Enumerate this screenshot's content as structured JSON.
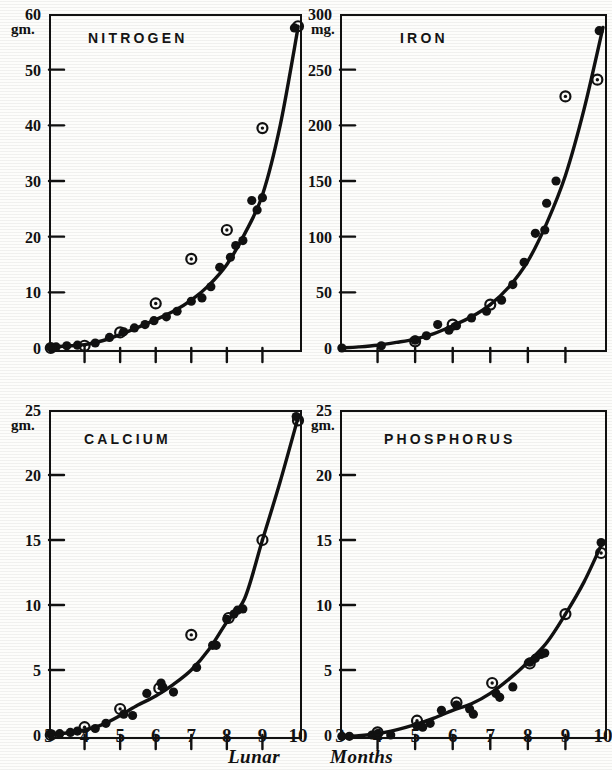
{
  "figure": {
    "background_color": "#fdfdfb",
    "ink_color": "#111111",
    "x_axis_title_part1": "Lunar",
    "x_axis_title_part2": "Months"
  },
  "chart_data": [
    {
      "type": "scatter",
      "title": "NITROGEN",
      "panel": "top-left",
      "xlabel": "Lunar Months",
      "ylabel": "gm.",
      "yunit": "gm.",
      "xlim": [
        3,
        10
      ],
      "ylim": [
        0,
        60
      ],
      "xticks": [
        3,
        4,
        5,
        6,
        7,
        8,
        9,
        10
      ],
      "xticklabels": [
        "",
        "",
        "",
        "",
        "",
        "",
        "",
        ""
      ],
      "yticks": [
        0,
        10,
        20,
        30,
        40,
        50,
        60
      ],
      "yticklabels": [
        "0",
        "10",
        "20",
        "30",
        "40",
        "50",
        "60"
      ],
      "grid": false,
      "legend": "none",
      "series": [
        {
          "name": "individual-analyses",
          "marker": "filled-circle",
          "points": [
            [
              3.05,
              0.1
            ],
            [
              3.2,
              0.2
            ],
            [
              3.5,
              0.4
            ],
            [
              3.8,
              0.5
            ],
            [
              4.3,
              0.9
            ],
            [
              4.7,
              1.9
            ],
            [
              5.1,
              2.9
            ],
            [
              5.4,
              3.6
            ],
            [
              5.7,
              4.2
            ],
            [
              5.95,
              4.9
            ],
            [
              6.3,
              5.6
            ],
            [
              6.6,
              6.6
            ],
            [
              7.0,
              8.4
            ],
            [
              7.3,
              9.0
            ],
            [
              7.55,
              11.0
            ],
            [
              7.8,
              14.5
            ],
            [
              8.1,
              16.3
            ],
            [
              8.25,
              18.4
            ],
            [
              8.45,
              19.3
            ],
            [
              8.7,
              26.5
            ],
            [
              8.85,
              24.8
            ],
            [
              9.0,
              27.0
            ],
            [
              9.9,
              57.5
            ]
          ]
        },
        {
          "name": "mean-values",
          "marker": "circled-dot",
          "points": [
            [
              3.05,
              0.0
            ],
            [
              4.0,
              0.4
            ],
            [
              5.0,
              2.8
            ],
            [
              6.0,
              8.0
            ],
            [
              7.0,
              16.0
            ],
            [
              8.0,
              21.2
            ],
            [
              9.0,
              39.5
            ],
            [
              10.0,
              57.8
            ]
          ]
        }
      ],
      "curve": [
        [
          3.0,
          0.2
        ],
        [
          3.5,
          0.35
        ],
        [
          4.0,
          0.6
        ],
        [
          4.5,
          1.3
        ],
        [
          5.0,
          2.4
        ],
        [
          5.5,
          3.7
        ],
        [
          6.0,
          5.1
        ],
        [
          6.5,
          6.6
        ],
        [
          7.0,
          8.6
        ],
        [
          7.5,
          11.3
        ],
        [
          8.0,
          15.0
        ],
        [
          8.5,
          20.5
        ],
        [
          9.0,
          27.5
        ],
        [
          9.5,
          40.0
        ],
        [
          10.0,
          57.5
        ]
      ]
    },
    {
      "type": "scatter",
      "title": "IRON",
      "panel": "top-right",
      "xlabel": "Lunar Months",
      "ylabel": "mg.",
      "yunit": "mg.",
      "xlim": [
        3,
        10
      ],
      "ylim": [
        0,
        300
      ],
      "xticks": [
        3,
        4,
        5,
        6,
        7,
        8,
        9,
        10
      ],
      "xticklabels": [
        "",
        "",
        "",
        "",
        "",
        "",
        "",
        ""
      ],
      "yticks": [
        0,
        50,
        100,
        150,
        200,
        250,
        300
      ],
      "yticklabels": [
        "0",
        "50",
        "100",
        "150",
        "200",
        "250",
        "300"
      ],
      "grid": false,
      "legend": "none",
      "series": [
        {
          "name": "individual-analyses",
          "marker": "filled-circle",
          "points": [
            [
              3.05,
              0.0
            ],
            [
              4.1,
              2.0
            ],
            [
              5.0,
              7.0
            ],
            [
              5.3,
              11.0
            ],
            [
              5.6,
              21.0
            ],
            [
              5.9,
              16.0
            ],
            [
              6.1,
              20.0
            ],
            [
              6.5,
              27.0
            ],
            [
              6.9,
              33.0
            ],
            [
              7.3,
              43.0
            ],
            [
              7.6,
              57.0
            ],
            [
              7.9,
              77.0
            ],
            [
              8.2,
              103.0
            ],
            [
              8.45,
              106.0
            ],
            [
              8.5,
              130.0
            ],
            [
              8.75,
              150.0
            ],
            [
              9.9,
              285.0
            ]
          ]
        },
        {
          "name": "mean-values",
          "marker": "circled-dot",
          "points": [
            [
              5.0,
              6.0
            ],
            [
              6.0,
              21.0
            ],
            [
              7.0,
              39.0
            ],
            [
              9.0,
              226.0
            ],
            [
              9.85,
              241.0
            ]
          ]
        }
      ],
      "curve": [
        [
          3.0,
          0.0
        ],
        [
          3.5,
          1.0
        ],
        [
          4.0,
          2.5
        ],
        [
          4.5,
          5.0
        ],
        [
          5.0,
          8.0
        ],
        [
          5.5,
          13.0
        ],
        [
          6.0,
          20.0
        ],
        [
          6.5,
          28.0
        ],
        [
          7.0,
          39.0
        ],
        [
          7.5,
          55.0
        ],
        [
          8.0,
          78.0
        ],
        [
          8.5,
          112.0
        ],
        [
          9.0,
          155.0
        ],
        [
          9.5,
          215.0
        ],
        [
          10.0,
          288.0
        ]
      ]
    },
    {
      "type": "scatter",
      "title": "CALCIUM",
      "panel": "bottom-left",
      "xlabel": "Lunar Months",
      "ylabel": "gm.",
      "yunit": "gm.",
      "xlim": [
        3,
        10
      ],
      "ylim": [
        0,
        25
      ],
      "xticks": [
        3,
        4,
        5,
        6,
        7,
        8,
        9,
        10
      ],
      "xticklabels": [
        "3",
        "4",
        "5",
        "6",
        "7",
        "8",
        "9",
        "10"
      ],
      "yticks": [
        0,
        5,
        10,
        15,
        20,
        25
      ],
      "yticklabels": [
        "0",
        "5",
        "10",
        "15",
        "20",
        "25"
      ],
      "grid": false,
      "legend": "none",
      "series": [
        {
          "name": "individual-analyses",
          "marker": "filled-circle",
          "points": [
            [
              3.05,
              0.05
            ],
            [
              3.3,
              0.1
            ],
            [
              3.6,
              0.2
            ],
            [
              3.8,
              0.3
            ],
            [
              4.3,
              0.5
            ],
            [
              4.6,
              0.9
            ],
            [
              5.1,
              1.6
            ],
            [
              5.35,
              1.5
            ],
            [
              5.75,
              3.2
            ],
            [
              6.15,
              4.0
            ],
            [
              6.2,
              3.7
            ],
            [
              6.5,
              3.3
            ],
            [
              7.15,
              5.2
            ],
            [
              7.6,
              6.9
            ],
            [
              7.7,
              6.9
            ],
            [
              8.0,
              8.9
            ],
            [
              8.2,
              9.3
            ],
            [
              8.3,
              9.6
            ],
            [
              8.45,
              9.7
            ],
            [
              9.95,
              24.5
            ]
          ]
        },
        {
          "name": "mean-values",
          "marker": "circled-dot",
          "points": [
            [
              3.05,
              0.0
            ],
            [
              4.0,
              0.6
            ],
            [
              5.0,
              2.0
            ],
            [
              6.1,
              3.6
            ],
            [
              7.0,
              7.7
            ],
            [
              8.05,
              9.0
            ],
            [
              9.0,
              15.0
            ],
            [
              10.0,
              24.2
            ]
          ]
        }
      ],
      "curve": [
        [
          3.0,
          0.05
        ],
        [
          3.5,
          0.15
        ],
        [
          4.0,
          0.4
        ],
        [
          4.5,
          0.8
        ],
        [
          5.0,
          1.5
        ],
        [
          5.5,
          2.3
        ],
        [
          6.0,
          3.0
        ],
        [
          6.5,
          3.9
        ],
        [
          7.0,
          5.0
        ],
        [
          7.5,
          6.6
        ],
        [
          8.0,
          8.7
        ],
        [
          8.5,
          10.5
        ],
        [
          9.0,
          15.0
        ],
        [
          9.5,
          19.5
        ],
        [
          10.0,
          24.4
        ]
      ]
    },
    {
      "type": "scatter",
      "title": "PHOSPHORUS",
      "panel": "bottom-right",
      "xlabel": "Lunar Months",
      "ylabel": "gm.",
      "yunit": "gm.",
      "xlim": [
        3,
        10
      ],
      "ylim": [
        0,
        25
      ],
      "xticks": [
        3,
        4,
        5,
        6,
        7,
        8,
        9,
        10
      ],
      "xticklabels": [
        "3",
        "4",
        "5",
        "6",
        "7",
        "8",
        "9",
        "10"
      ],
      "yticks": [
        0,
        5,
        10,
        15,
        20,
        25
      ],
      "yticklabels": [
        "0",
        "5",
        "10",
        "15",
        "20",
        "25"
      ],
      "grid": false,
      "legend": "none",
      "series": [
        {
          "name": "individual-analyses",
          "marker": "filled-circle",
          "points": [
            [
              3.05,
              -0.1
            ],
            [
              3.25,
              -0.1
            ],
            [
              3.85,
              0.0
            ],
            [
              4.0,
              0.1
            ],
            [
              4.35,
              0.0
            ],
            [
              5.05,
              0.7
            ],
            [
              5.2,
              0.6
            ],
            [
              5.4,
              0.9
            ],
            [
              5.7,
              1.9
            ],
            [
              6.1,
              2.3
            ],
            [
              6.45,
              2.0
            ],
            [
              6.55,
              1.6
            ],
            [
              7.15,
              3.2
            ],
            [
              7.25,
              2.9
            ],
            [
              7.6,
              3.7
            ],
            [
              8.05,
              5.6
            ],
            [
              8.2,
              5.9
            ],
            [
              8.35,
              6.2
            ],
            [
              8.45,
              6.3
            ],
            [
              9.95,
              14.8
            ]
          ]
        },
        {
          "name": "mean-values",
          "marker": "circled-dot",
          "points": [
            [
              4.0,
              0.2
            ],
            [
              5.05,
              1.1
            ],
            [
              6.1,
              2.5
            ],
            [
              7.05,
              4.0
            ],
            [
              8.05,
              5.5
            ],
            [
              9.0,
              9.3
            ],
            [
              9.95,
              14.0
            ]
          ]
        }
      ],
      "curve": [
        [
          3.0,
          -0.1
        ],
        [
          3.5,
          -0.05
        ],
        [
          4.0,
          0.1
        ],
        [
          4.5,
          0.4
        ],
        [
          5.0,
          0.8
        ],
        [
          5.5,
          1.3
        ],
        [
          6.0,
          1.9
        ],
        [
          6.5,
          2.4
        ],
        [
          7.0,
          3.2
        ],
        [
          7.5,
          4.3
        ],
        [
          8.0,
          5.6
        ],
        [
          8.5,
          7.1
        ],
        [
          9.0,
          9.3
        ],
        [
          9.5,
          11.8
        ],
        [
          10.0,
          14.9
        ]
      ]
    }
  ]
}
